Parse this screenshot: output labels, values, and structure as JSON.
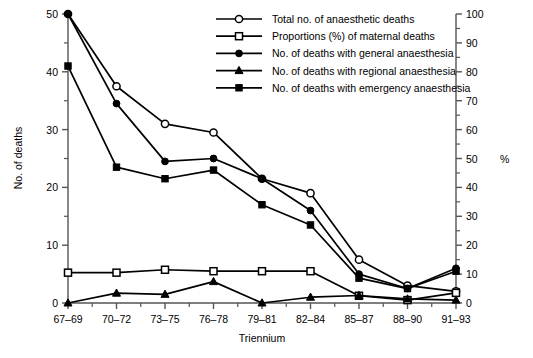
{
  "chart_data": {
    "type": "line",
    "title": "",
    "xlabel": "Triennium",
    "ylabel": "No. of deaths",
    "y2label": "%",
    "categories": [
      "67–69",
      "70–72",
      "73–75",
      "76–78",
      "79–81",
      "82–84",
      "85–87",
      "88–90",
      "91–93"
    ],
    "ylim": [
      0,
      50
    ],
    "yticks": [
      0,
      10,
      20,
      30,
      40,
      50
    ],
    "yminor": [
      5,
      15,
      25,
      35,
      45
    ],
    "y2lim": [
      0,
      100
    ],
    "y2ticks": [
      0,
      10,
      20,
      30,
      40,
      50,
      60,
      70,
      80,
      90,
      100
    ],
    "grid": false,
    "legend_position": "top-right",
    "series": [
      {
        "name": "Total no. of anaesthetic deaths",
        "marker": "open-circle",
        "axis": "left",
        "values": [
          50,
          37.5,
          31,
          29.5,
          21.5,
          19,
          7.5,
          3,
          2
        ]
      },
      {
        "name": "Proportions (%) of maternal deaths",
        "marker": "open-square",
        "axis": "right",
        "values": [
          10.5,
          10.5,
          11.5,
          11,
          11,
          11,
          2.5,
          1,
          3.5
        ]
      },
      {
        "name": "No. of deaths with general anaesthesia",
        "marker": "filled-circle",
        "axis": "left",
        "values": [
          50,
          34.5,
          24.5,
          25,
          21.5,
          16,
          5,
          2.5,
          6
        ]
      },
      {
        "name": "No. of deaths with regional anaesthesia",
        "marker": "filled-triangle",
        "axis": "left",
        "values": [
          0,
          1.7,
          1.5,
          3.7,
          0,
          1,
          1.3,
          0.7,
          0.5
        ]
      },
      {
        "name": "No. of deaths with emergency anaesthesia",
        "marker": "filled-square",
        "axis": "left",
        "values": [
          41,
          23.5,
          21.5,
          23,
          17,
          13.5,
          4.3,
          2.5,
          5.5
        ]
      }
    ]
  },
  "axes": {
    "y_title": "No. of deaths",
    "x_title": "Triennium",
    "y2_title": "%",
    "y_ticklabels": [
      "0",
      "10",
      "20",
      "30",
      "40",
      "50"
    ],
    "y2_ticklabels": [
      "0",
      "10",
      "20",
      "30",
      "40",
      "50",
      "60",
      "70",
      "80",
      "90",
      "100"
    ],
    "x_ticklabels": [
      "67–69",
      "70–72",
      "73–75",
      "76–78",
      "79–81",
      "82–84",
      "85–87",
      "88–90",
      "91–93"
    ]
  },
  "legend": {
    "items": [
      {
        "label": "Total no. of anaesthetic deaths",
        "marker": "open-circle"
      },
      {
        "label": "Proportions (%) of maternal deaths",
        "marker": "open-square"
      },
      {
        "label": "No. of deaths with general anaesthesia",
        "marker": "filled-circle"
      },
      {
        "label": "No. of deaths with regional anaesthesia",
        "marker": "filled-triangle"
      },
      {
        "label": "No. of deaths with emergency anaesthesia",
        "marker": "filled-square"
      }
    ]
  },
  "colors": {
    "line": "#000000",
    "axis": "#555555",
    "background": "#ffffff"
  }
}
